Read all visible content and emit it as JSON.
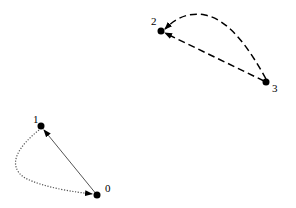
{
  "diagram": {
    "type": "directed-graph",
    "nodes": [
      {
        "id": "0",
        "label": "0",
        "x": 97,
        "y": 195,
        "label_x": 105,
        "label_y": 192
      },
      {
        "id": "1",
        "label": "1",
        "x": 41,
        "y": 126,
        "label_x": 33,
        "label_y": 123
      },
      {
        "id": "2",
        "label": "2",
        "x": 161,
        "y": 31,
        "label_x": 151,
        "label_y": 25
      },
      {
        "id": "3",
        "label": "3",
        "x": 266,
        "y": 82,
        "label_x": 272,
        "label_y": 92
      }
    ],
    "edges": [
      {
        "from": "0",
        "to": "1",
        "style": "solid",
        "shape": "straight"
      },
      {
        "from": "1",
        "to": "0",
        "style": "dotted",
        "shape": "curved"
      },
      {
        "from": "3",
        "to": "2",
        "style": "dashed",
        "shape": "straight"
      },
      {
        "from": "3",
        "to": "2",
        "style": "dashed",
        "shape": "curved"
      }
    ]
  }
}
